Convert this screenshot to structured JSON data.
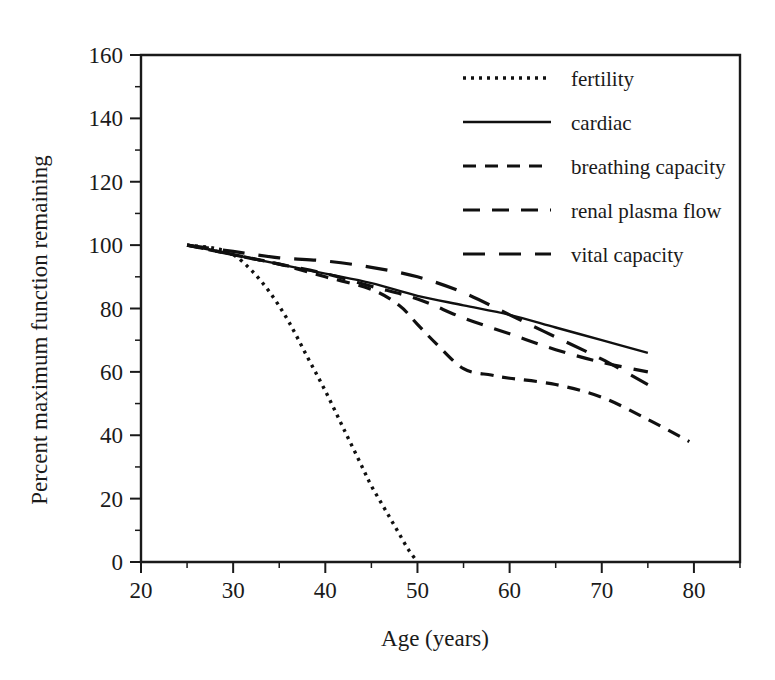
{
  "chart_data": {
    "type": "line",
    "title": "",
    "xlabel": "Age (years)",
    "ylabel": "Percent maximum function remaining",
    "xlim": [
      20,
      85
    ],
    "ylim": [
      0,
      160
    ],
    "xticks": [
      20,
      30,
      40,
      50,
      60,
      70,
      80
    ],
    "xtick_labels": [
      "20",
      "30",
      "40",
      "50",
      "60",
      "70",
      "80"
    ],
    "xminor_step": 5,
    "yticks": [
      0,
      20,
      40,
      60,
      80,
      100,
      120,
      140,
      160
    ],
    "ytick_labels": [
      "0",
      "20",
      "40",
      "60",
      "80",
      "100",
      "120",
      "140",
      "160"
    ],
    "yminor_step": 10,
    "grid": false,
    "legend_position": "upper right",
    "series": [
      {
        "name": "fertility",
        "dash": "dotted",
        "dasharray": "3,5",
        "width": 3.4,
        "x": [
          25,
          28,
          30,
          32,
          34,
          36,
          38,
          40,
          42,
          44,
          45,
          46,
          47,
          48,
          49,
          50
        ],
        "y": [
          100,
          99,
          97,
          92,
          85,
          76,
          65,
          54,
          42,
          30,
          24,
          19,
          14,
          9,
          4,
          0
        ]
      },
      {
        "name": "cardiac",
        "dash": "solid",
        "dasharray": "",
        "width": 2.4,
        "x": [
          25,
          30,
          35,
          40,
          45,
          50,
          55,
          60,
          65,
          70,
          75
        ],
        "y": [
          100,
          97,
          94,
          91,
          88,
          84,
          81,
          78,
          74,
          70,
          66
        ]
      },
      {
        "name": "breathing capacity",
        "dash": "short-dash",
        "dasharray": "13,9",
        "width": 3.2,
        "x": [
          25,
          30,
          35,
          40,
          45,
          48,
          50,
          52,
          55,
          58,
          60,
          65,
          70,
          75,
          79.5
        ],
        "y": [
          100,
          97,
          94,
          90,
          86,
          81,
          75,
          69,
          61,
          59,
          58,
          56,
          52,
          45,
          38
        ]
      },
      {
        "name": "renal plasma flow",
        "dash": "medium-dash",
        "dasharray": "17,12",
        "width": 3.2,
        "x": [
          25,
          30,
          35,
          40,
          45,
          50,
          55,
          60,
          65,
          70,
          75
        ],
        "y": [
          100,
          97,
          94,
          91,
          87,
          83,
          77,
          72,
          67,
          63,
          60
        ]
      },
      {
        "name": "vital capacity",
        "dash": "long-dash",
        "dasharray": "22,14",
        "width": 3.2,
        "x": [
          25,
          30,
          35,
          40,
          45,
          50,
          55,
          60,
          65,
          70,
          75
        ],
        "y": [
          100,
          98,
          96,
          95,
          93,
          90,
          85,
          78,
          71,
          64,
          56
        ]
      }
    ],
    "legend_entries": [
      {
        "label": "fertility",
        "dasharray": "3,5",
        "width": 3.4
      },
      {
        "label": "cardiac",
        "dasharray": "",
        "width": 2.6
      },
      {
        "label": "breathing capacity",
        "dasharray": "13,9",
        "width": 3.2
      },
      {
        "label": "renal plasma flow",
        "dasharray": "17,12",
        "width": 3.2
      },
      {
        "label": "vital capacity",
        "dasharray": "22,14",
        "width": 3.2
      }
    ],
    "colors": {
      "ink": "#101010",
      "axis": "#1a1a1a",
      "background": "#ffffff"
    }
  }
}
